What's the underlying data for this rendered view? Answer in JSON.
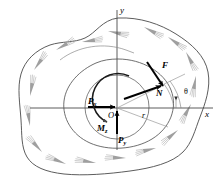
{
  "figure": {
    "background_color": "#ffffff",
    "line_color": "#3a3a3a",
    "hatch_color": "#8a8a8a",
    "vector_color": "#000000",
    "thin_color": "#9a9a9a"
  },
  "axes": {
    "x_label": "x",
    "y_label": "y",
    "origin_label": "O"
  },
  "vectors": [
    {
      "key": "F",
      "label": "F",
      "description": "resultant force vector"
    },
    {
      "key": "N",
      "label": "N",
      "description": "normal force vector"
    },
    {
      "key": "Px",
      "label": "P",
      "subscript": "x",
      "description": "force component along x"
    },
    {
      "key": "Py",
      "label": "P",
      "subscript": "y",
      "description": "force component along y"
    },
    {
      "key": "Mz",
      "label": "M",
      "subscript": "z",
      "description": "moment about z axis"
    }
  ],
  "annotations": {
    "radius_label": "r",
    "angle_label": "θ"
  },
  "labels": {
    "y_axis": "y",
    "x_axis": "x",
    "origin": "O",
    "force_F": "F",
    "force_N": "N",
    "force_P_base": "P",
    "force_Px_sub": "x",
    "force_Py_sub": "y",
    "moment_M_base": "M",
    "moment_Mz_sub": "z",
    "radius": "r",
    "theta": "θ"
  }
}
